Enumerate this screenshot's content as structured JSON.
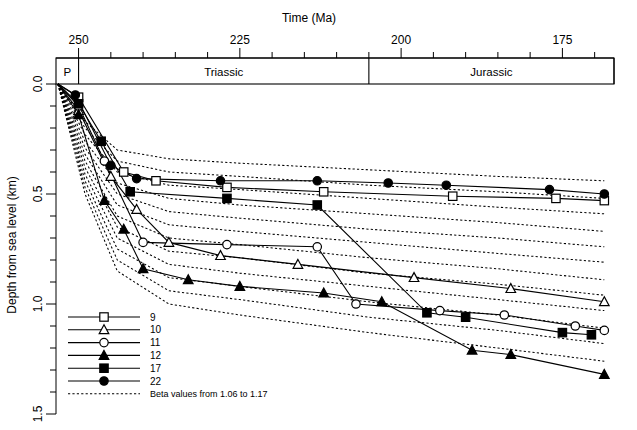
{
  "chart_data": {
    "type": "line",
    "title": "Time (Ma)",
    "xlabel": "Time (Ma)",
    "ylabel": "Depth from sea level (km)",
    "xlim": [
      253,
      167
    ],
    "ylim": [
      0.0,
      1.5
    ],
    "x_ticks_major": [
      250,
      225,
      200,
      175
    ],
    "x_ticks_minor": [
      245,
      240,
      235,
      230,
      220,
      215,
      210,
      205,
      195,
      190,
      185,
      180,
      170
    ],
    "y_ticks_major": [
      0.0,
      0.5,
      1.0,
      1.5
    ],
    "y_ticks_minor": [
      0.1,
      0.2,
      0.3,
      0.4,
      0.6,
      0.7,
      0.8,
      0.9,
      1.1,
      1.2,
      1.3,
      1.4
    ],
    "x_tick_labels": [
      "250",
      "225",
      "200",
      "175"
    ],
    "y_tick_labels": [
      "0.0",
      "0.5",
      "1.0",
      "1.5"
    ],
    "grid": false,
    "legend_position": "lower-left",
    "periods": [
      {
        "label": "P",
        "start": 253.5,
        "end": 250.0
      },
      {
        "label": "Triassic",
        "start": 250.0,
        "end": 205.0
      },
      {
        "label": "Jurassic",
        "start": 205.0,
        "end": 167.0
      }
    ],
    "legend": [
      {
        "label": "9",
        "marker": "open-square",
        "style": "solid"
      },
      {
        "label": "10",
        "marker": "open-triangle",
        "style": "solid"
      },
      {
        "label": "11",
        "marker": "open-circle",
        "style": "solid"
      },
      {
        "label": "12",
        "marker": "filled-triangle",
        "style": "solid"
      },
      {
        "label": "17",
        "marker": "filled-square",
        "style": "solid"
      },
      {
        "label": "22",
        "marker": "filled-circle",
        "style": "solid"
      }
    ],
    "legend_extra": {
      "label": "Beta values from 1.06 to 1.17",
      "marker": "none",
      "style": "dotted"
    },
    "beta_note": "Beta values from 1.06 to 1.17",
    "beta_range": [
      1.06,
      1.17
    ],
    "series": [
      {
        "name": "9",
        "marker": "open-square",
        "x": [
          253.2,
          250.0,
          243.0,
          238.0,
          227.0,
          212.0,
          192.0,
          176.0,
          168.5
        ],
        "y": [
          0.0,
          0.06,
          0.4,
          0.44,
          0.47,
          0.49,
          0.51,
          0.52,
          0.53
        ]
      },
      {
        "name": "10",
        "marker": "open-triangle",
        "x": [
          253.2,
          250.0,
          245.0,
          241.0,
          236.0,
          228.0,
          216.0,
          198.0,
          183.0,
          168.5
        ],
        "y": [
          0.0,
          0.12,
          0.42,
          0.57,
          0.72,
          0.78,
          0.82,
          0.88,
          0.93,
          0.99
        ]
      },
      {
        "name": "11",
        "marker": "open-circle",
        "x": [
          253.2,
          250.0,
          246.0,
          240.0,
          227.0,
          213.0,
          207.0,
          194.0,
          184.0,
          173.0,
          168.5
        ],
        "y": [
          0.0,
          0.1,
          0.35,
          0.72,
          0.73,
          0.74,
          1.0,
          1.03,
          1.05,
          1.1,
          1.12
        ]
      },
      {
        "name": "12",
        "marker": "filled-triangle",
        "x": [
          253.2,
          250.0,
          246.0,
          243.0,
          240.0,
          233.0,
          225.0,
          212.0,
          203.0,
          189.0,
          183.0,
          168.5
        ],
        "y": [
          0.0,
          0.14,
          0.53,
          0.66,
          0.84,
          0.89,
          0.92,
          0.95,
          0.99,
          1.21,
          1.23,
          1.32
        ]
      },
      {
        "name": "17",
        "marker": "filled-square",
        "x": [
          253.2,
          250.0,
          246.5,
          242.0,
          227.0,
          213.0,
          196.0,
          190.0,
          175.0,
          170.5
        ],
        "y": [
          0.0,
          0.09,
          0.26,
          0.49,
          0.52,
          0.55,
          1.04,
          1.06,
          1.13,
          1.14
        ]
      },
      {
        "name": "22",
        "marker": "filled-circle",
        "x": [
          253.2,
          250.5,
          245.0,
          241.0,
          228.0,
          213.0,
          202.0,
          193.0,
          177.0,
          168.5
        ],
        "y": [
          0.0,
          0.05,
          0.37,
          0.43,
          0.44,
          0.44,
          0.45,
          0.46,
          0.48,
          0.5
        ]
      }
    ],
    "beta_curves": [
      {
        "beta": 1.06,
        "x": [
          253.2,
          249.0,
          244.0,
          236.0,
          225.0,
          205.0,
          185.0,
          168.5
        ],
        "y": [
          0.0,
          0.17,
          0.3,
          0.34,
          0.36,
          0.39,
          0.42,
          0.44
        ]
      },
      {
        "beta": 1.07,
        "x": [
          253.2,
          249.0,
          244.0,
          236.0,
          225.0,
          205.0,
          185.0,
          168.5
        ],
        "y": [
          0.0,
          0.2,
          0.35,
          0.4,
          0.42,
          0.46,
          0.49,
          0.52
        ]
      },
      {
        "beta": 1.08,
        "x": [
          253.2,
          249.0,
          244.0,
          236.0,
          225.0,
          205.0,
          185.0,
          168.5
        ],
        "y": [
          0.0,
          0.23,
          0.4,
          0.46,
          0.48,
          0.52,
          0.56,
          0.59
        ]
      },
      {
        "beta": 1.09,
        "x": [
          253.2,
          249.0,
          244.0,
          236.0,
          225.0,
          205.0,
          185.0,
          168.5
        ],
        "y": [
          0.0,
          0.26,
          0.45,
          0.52,
          0.55,
          0.59,
          0.63,
          0.67
        ]
      },
      {
        "beta": 1.1,
        "x": [
          253.2,
          249.0,
          244.0,
          236.0,
          225.0,
          205.0,
          185.0,
          168.5
        ],
        "y": [
          0.0,
          0.29,
          0.5,
          0.58,
          0.61,
          0.66,
          0.7,
          0.74
        ]
      },
      {
        "beta": 1.11,
        "x": [
          253.2,
          249.0,
          244.0,
          236.0,
          225.0,
          205.0,
          185.0,
          168.5
        ],
        "y": [
          0.0,
          0.32,
          0.55,
          0.64,
          0.67,
          0.72,
          0.77,
          0.81
        ]
      },
      {
        "beta": 1.12,
        "x": [
          253.2,
          249.0,
          244.0,
          236.0,
          225.0,
          205.0,
          185.0,
          168.5
        ],
        "y": [
          0.0,
          0.35,
          0.6,
          0.7,
          0.73,
          0.79,
          0.84,
          0.89
        ]
      },
      {
        "beta": 1.13,
        "x": [
          253.2,
          249.0,
          244.0,
          236.0,
          225.0,
          205.0,
          185.0,
          168.5
        ],
        "y": [
          0.0,
          0.38,
          0.65,
          0.76,
          0.79,
          0.86,
          0.91,
          0.96
        ]
      },
      {
        "beta": 1.14,
        "x": [
          253.2,
          249.0,
          244.0,
          236.0,
          225.0,
          205.0,
          185.0,
          168.5
        ],
        "y": [
          0.0,
          0.41,
          0.7,
          0.82,
          0.86,
          0.92,
          0.98,
          1.03
        ]
      },
      {
        "beta": 1.15,
        "x": [
          253.2,
          249.0,
          244.0,
          236.0,
          225.0,
          205.0,
          185.0,
          168.5
        ],
        "y": [
          0.0,
          0.44,
          0.75,
          0.88,
          0.92,
          0.99,
          1.05,
          1.11
        ]
      },
      {
        "beta": 1.16,
        "x": [
          253.2,
          249.0,
          244.0,
          236.0,
          225.0,
          205.0,
          185.0,
          168.5
        ],
        "y": [
          0.0,
          0.47,
          0.8,
          0.94,
          0.98,
          1.06,
          1.12,
          1.18
        ]
      },
      {
        "beta": 1.17,
        "x": [
          253.2,
          249.0,
          244.0,
          236.0,
          225.0,
          205.0,
          185.0,
          168.5
        ],
        "y": [
          0.0,
          0.5,
          0.85,
          1.0,
          1.05,
          1.13,
          1.2,
          1.26
        ]
      }
    ]
  }
}
